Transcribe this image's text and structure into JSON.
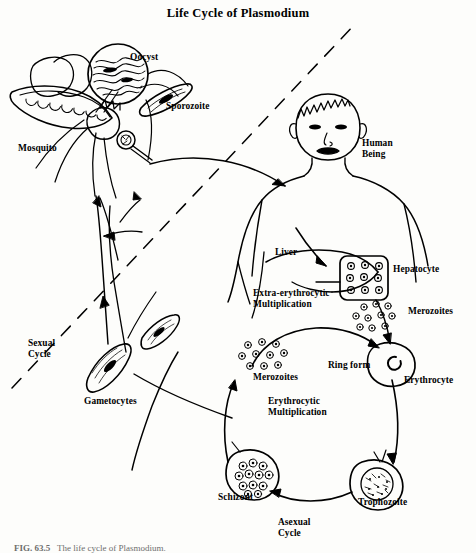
{
  "figure": {
    "title": "Life Cycle of Plasmodium",
    "caption_number": "FIG. 63.5",
    "caption_text": "The life cycle of Plasmodium.",
    "ink_color": "#000000",
    "background_color": "#fdfdfb"
  },
  "labels": {
    "oocyst": "Oocyst",
    "sporozoite": "Sporozoite",
    "mosquito": "Mosquito",
    "human_being": "Human\nBeing",
    "liver": "Liver",
    "hepatocyte": "Hepatocyte",
    "extra_erythrocytic": "Extra-erythrocytic\nMultiplication",
    "merozoites_liver": "Merozoites",
    "merozoites_blood": "Merozoites",
    "ring_form": "Ring form",
    "erythrocyte": "Erythrocyte",
    "erythrocytic_multiplication": "Erythrocytic\nMultiplication",
    "schizont": "Schizont",
    "trophozoite": "Trophozoite",
    "asexual_cycle": "Asexual\nCycle",
    "sexual_cycle": "Sexual\nCycle",
    "gametocytes": "Gametocytes"
  },
  "diagram_content": {
    "type": "biological-cycle-diagram",
    "divider": "dashed diagonal line separating mosquito (sexual cycle, left) from human host (asexual cycle, right)",
    "stages": [
      "Oocyst",
      "Sporozoite",
      "Hepatocyte",
      "Merozoites",
      "Ring form",
      "Trophozoite",
      "Schizont",
      "Gametocytes"
    ],
    "hosts": [
      "Mosquito",
      "Human Being"
    ],
    "cycles": [
      "Sexual Cycle",
      "Asexual Cycle",
      "Extra-erythrocytic Multiplication",
      "Erythrocytic Multiplication"
    ]
  }
}
